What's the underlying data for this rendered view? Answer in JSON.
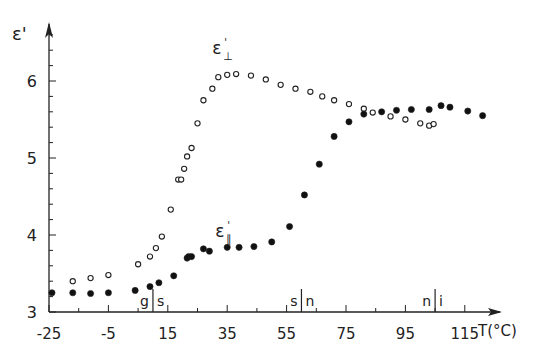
{
  "chart_data": {
    "type": "scatter",
    "title": "",
    "xlabel": "T(°C)",
    "ylabel": "ε'",
    "xlim": [
      -25,
      125
    ],
    "ylim": [
      3,
      6.7
    ],
    "x_ticks": [
      -25,
      -5,
      15,
      35,
      55,
      75,
      95,
      115
    ],
    "x_tick_labels": [
      "-25",
      "-5",
      "15",
      "35",
      "55",
      "75",
      "95",
      "115"
    ],
    "y_ticks": [
      3,
      4,
      5,
      6
    ],
    "y_tick_labels": [
      "3",
      "4",
      "5",
      "6"
    ],
    "grid": false,
    "phase_markers": [
      {
        "x": 10,
        "label_left": "g",
        "label_right": "s"
      },
      {
        "x": 60,
        "label_left": "s",
        "label_right": "n"
      },
      {
        "x": 105,
        "label_left": "n",
        "label_right": "i"
      }
    ],
    "series": [
      {
        "name": "ε'⊥",
        "marker": "open-circle",
        "label": "ε'⊥",
        "label_pos": [
          30,
          6.35
        ],
        "x": [
          -17,
          -11,
          -5,
          5,
          9,
          11,
          13,
          16,
          18.5,
          19.5,
          20.5,
          21.5,
          23,
          25,
          27,
          30,
          32,
          35,
          38,
          43,
          48,
          53,
          58,
          63,
          67,
          71,
          76,
          81,
          84,
          90,
          95,
          100,
          103,
          104.5
        ],
        "y": [
          3.4,
          3.44,
          3.48,
          3.62,
          3.72,
          3.83,
          3.98,
          4.33,
          4.72,
          4.72,
          4.86,
          5.02,
          5.13,
          5.45,
          5.75,
          5.9,
          6.05,
          6.08,
          6.09,
          6.07,
          6.02,
          5.95,
          5.9,
          5.86,
          5.8,
          5.75,
          5.7,
          5.64,
          5.59,
          5.54,
          5.5,
          5.45,
          5.42,
          5.44
        ]
      },
      {
        "name": "ε'∥",
        "marker": "filled-circle",
        "label": "ε'∥",
        "label_pos": [
          31,
          3.98
        ],
        "x": [
          -24,
          -17,
          -11,
          -5,
          4,
          9,
          12,
          17,
          21.5,
          22,
          23,
          27,
          29,
          35,
          39,
          44,
          50,
          56,
          61,
          66,
          71,
          76,
          81,
          87,
          92,
          97,
          103,
          107,
          110,
          116,
          121
        ],
        "y": [
          3.25,
          3.25,
          3.24,
          3.25,
          3.28,
          3.33,
          3.38,
          3.47,
          3.7,
          3.72,
          3.72,
          3.82,
          3.79,
          3.84,
          3.84,
          3.85,
          3.91,
          4.11,
          4.52,
          4.92,
          5.28,
          5.47,
          5.57,
          5.6,
          5.62,
          5.63,
          5.63,
          5.68,
          5.66,
          5.61,
          5.55
        ]
      }
    ]
  }
}
